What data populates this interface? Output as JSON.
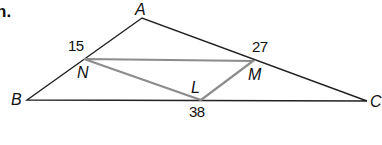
{
  "problem": {
    "number_fragment": "n."
  },
  "diagram": {
    "outer_triangle": {
      "vertices": [
        "A",
        "B",
        "C"
      ],
      "stroke_color": "#222222"
    },
    "inner_triangle": {
      "vertices": [
        "N",
        "L",
        "M"
      ],
      "stroke_color": "#8c8c8c"
    },
    "labels": {
      "A": "A",
      "B": "B",
      "C": "C",
      "N": "N",
      "M": "M",
      "L": "L"
    },
    "segment_values": {
      "at_N": "15",
      "at_M": "27",
      "at_L": "38"
    }
  }
}
